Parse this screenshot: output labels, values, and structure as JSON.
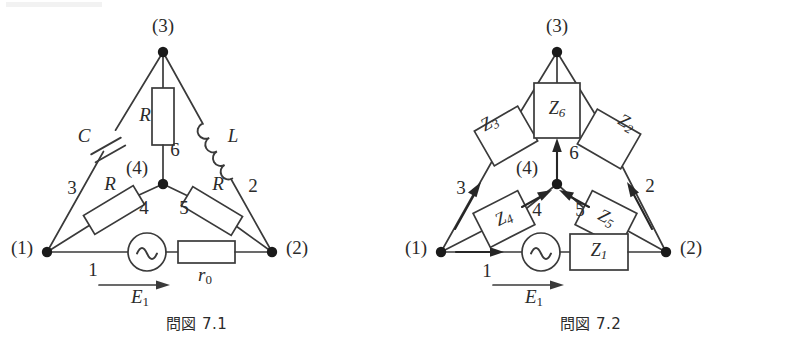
{
  "sheet": {
    "background": "#ffffff",
    "ink_color": "#3a3a3a",
    "node_color": "#1a1a1a"
  },
  "figures": [
    {
      "id": "fig-7-1",
      "caption": "問図 7.1",
      "description": "Network graph with physical circuit elements",
      "nodes": [
        {
          "id": "n1",
          "label": "(1)",
          "x": 47,
          "y": 252
        },
        {
          "id": "n2",
          "label": "(2)",
          "x": 272,
          "y": 252
        },
        {
          "id": "n3",
          "label": "(3)",
          "x": 163,
          "y": 52
        },
        {
          "id": "n4",
          "label": "(4)",
          "x": 163,
          "y": 184
        }
      ],
      "node_label_positions": [
        {
          "label": "(1)",
          "x": 22,
          "y": 250
        },
        {
          "label": "(2)",
          "x": 297,
          "y": 250
        },
        {
          "label": "(3)",
          "x": 163,
          "y": 28
        },
        {
          "label": "(4)",
          "x": 137,
          "y": 170
        }
      ],
      "branches": [
        {
          "number": "1",
          "from": "n1",
          "to": "n2",
          "label_x": 93,
          "label_y": 272,
          "element": "E1-source-and-r0"
        },
        {
          "number": "2",
          "from": "n2",
          "to": "n3",
          "label_x": 253,
          "label_y": 188,
          "element": "L"
        },
        {
          "number": "3",
          "from": "n1",
          "to": "n3",
          "label_x": 72,
          "label_y": 190,
          "element": "C"
        },
        {
          "number": "4",
          "from": "n1",
          "to": "n4",
          "label_x": 144,
          "label_y": 210,
          "element": "R"
        },
        {
          "number": "5",
          "from": "n4",
          "to": "n2",
          "label_x": 184,
          "label_y": 210,
          "element": "R"
        },
        {
          "number": "6",
          "from": "n4",
          "to": "n3",
          "label_x": 175,
          "label_y": 152,
          "element": "R"
        }
      ],
      "components": [
        {
          "name": "C",
          "type": "capacitor",
          "label": "C",
          "label_x": 84,
          "label_y": 138
        },
        {
          "name": "L",
          "type": "inductor",
          "label": "L",
          "label_x": 233,
          "label_y": 138
        },
        {
          "name": "R6",
          "type": "resistor",
          "label": "R",
          "label_x": 145,
          "label_y": 117
        },
        {
          "name": "R4",
          "type": "resistor",
          "label": "R",
          "label_x": 110,
          "label_y": 186
        },
        {
          "name": "R5",
          "type": "resistor",
          "label": "R",
          "label_x": 218,
          "label_y": 186
        },
        {
          "name": "r0",
          "type": "resistor",
          "label": "r",
          "sub": "0",
          "label_x": 205,
          "label_y": 277
        }
      ],
      "source": {
        "name": "E1",
        "type": "ac-voltage-source",
        "symbol": "sine",
        "label": "E",
        "sub": "1",
        "label_x": 140,
        "label_y": 299,
        "arrow": {
          "x1": 99,
          "y1": 285,
          "x2": 164,
          "y2": 285,
          "direction": "right"
        }
      }
    },
    {
      "id": "fig-7-2",
      "caption": "問図 7.2",
      "description": "Same network with generalized impedances and oriented branches",
      "nodes": [
        {
          "id": "n1",
          "label": "(1)",
          "x": 47,
          "y": 252
        },
        {
          "id": "n2",
          "label": "(2)",
          "x": 272,
          "y": 252
        },
        {
          "id": "n3",
          "label": "(3)",
          "x": 163,
          "y": 52
        },
        {
          "id": "n4",
          "label": "(4)",
          "x": 163,
          "y": 184
        }
      ],
      "node_label_positions": [
        {
          "label": "(1)",
          "x": 22,
          "y": 250
        },
        {
          "label": "(2)",
          "x": 297,
          "y": 250
        },
        {
          "label": "(3)",
          "x": 163,
          "y": 28
        },
        {
          "label": "(4)",
          "x": 133,
          "y": 170
        }
      ],
      "branches": [
        {
          "number": "1",
          "from": "n1",
          "to": "n2",
          "orientation": "n1-to-n2",
          "label_x": 93,
          "label_y": 273
        },
        {
          "number": "2",
          "from": "n2",
          "to": "n3",
          "orientation": "n2-to-n3",
          "label_x": 256,
          "label_y": 188
        },
        {
          "number": "3",
          "from": "n1",
          "to": "n3",
          "orientation": "n1-to-n3",
          "label_x": 67,
          "label_y": 190
        },
        {
          "number": "4",
          "from": "n1",
          "to": "n4",
          "orientation": "n1-to-n4",
          "label_x": 143,
          "label_y": 212
        },
        {
          "number": "5",
          "from": "n2",
          "to": "n4",
          "orientation": "n2-to-n4",
          "label_x": 186,
          "label_y": 212
        },
        {
          "number": "6",
          "from": "n4",
          "to": "n3",
          "orientation": "n4-to-n3",
          "label_x": 180,
          "label_y": 155
        }
      ],
      "impedances": [
        {
          "name": "Z1",
          "label": "Z",
          "sub": "1",
          "branch": "1",
          "shape": "box",
          "label_x": 205,
          "label_y": 252
        },
        {
          "name": "Z2",
          "label": "Z",
          "sub": "2",
          "branch": "2",
          "shape": "box-rotated",
          "label_x": 232,
          "label_y": 124
        },
        {
          "name": "Z3",
          "label": "Z",
          "sub": "3",
          "branch": "3",
          "shape": "box-rotated",
          "label_x": 96,
          "label_y": 124
        },
        {
          "name": "Z4",
          "label": "Z",
          "sub": "4",
          "branch": "4",
          "shape": "box-rotated",
          "label_x": 110,
          "label_y": 216
        },
        {
          "name": "Z5",
          "label": "Z",
          "sub": "5",
          "branch": "5",
          "shape": "box-rotated",
          "label_x": 219,
          "label_y": 216
        },
        {
          "name": "Z6",
          "label": "Z",
          "sub": "6",
          "branch": "6",
          "shape": "box",
          "label_x": 163,
          "label_y": 110
        }
      ],
      "source": {
        "name": "E1",
        "type": "ac-voltage-source",
        "symbol": "sine",
        "label": "E",
        "sub": "1",
        "label_x": 140,
        "label_y": 299,
        "arrow": {
          "x1": 99,
          "y1": 285,
          "x2": 164,
          "y2": 285,
          "direction": "right"
        }
      }
    }
  ]
}
